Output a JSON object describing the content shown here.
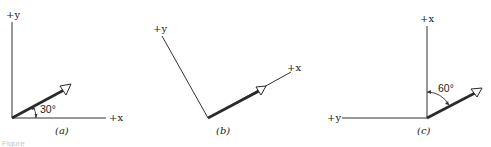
{
  "panels": [
    {
      "id": "a",
      "label": "(a)",
      "x_axis_label": "+x",
      "y_axis_label": "+y",
      "angle_label": "30°",
      "angle_reference": "+x axis",
      "description": "Vector at 30° above the +x axis in standard x-y orientation"
    },
    {
      "id": "b",
      "label": "(b)",
      "x_axis_label": "+x",
      "y_axis_label": "+y",
      "description": "Same vector with coordinate axes rotated so +x lies along the vector"
    },
    {
      "id": "c",
      "label": "(c)",
      "x_axis_label": "+x",
      "y_axis_label": "+y",
      "angle_label": "60°",
      "angle_reference": "+x axis (vertical)",
      "description": "Axes with +x pointing up and +y pointing left; vector at 60° from +x"
    }
  ],
  "caption": "Figure"
}
